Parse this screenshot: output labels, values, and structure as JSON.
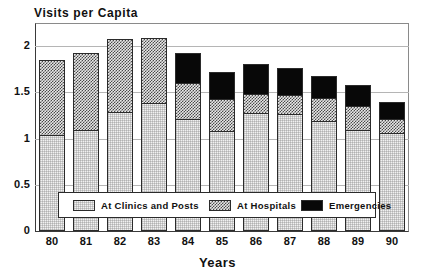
{
  "chart_data": {
    "type": "bar",
    "subtype": "stacked-vertical",
    "title": "Visits per Capita",
    "xlabel": "Years",
    "ylabel": "",
    "categories": [
      "80",
      "81",
      "82",
      "83",
      "84",
      "85",
      "86",
      "87",
      "88",
      "89",
      "90"
    ],
    "series": [
      {
        "name": "At Clinics and Posts",
        "fill": "light-dotted",
        "values": [
          1.03,
          1.08,
          1.28,
          1.37,
          1.2,
          1.07,
          1.27,
          1.25,
          1.18,
          1.08,
          1.05
        ]
      },
      {
        "name": "At Hospitals",
        "fill": "checkerboard-hatch",
        "values": [
          0.81,
          0.84,
          0.79,
          0.71,
          0.39,
          0.35,
          0.2,
          0.21,
          0.25,
          0.26,
          0.15
        ]
      },
      {
        "name": "Emergencies",
        "fill": "solid-black",
        "values": [
          0.0,
          0.0,
          0.0,
          0.0,
          0.32,
          0.29,
          0.33,
          0.29,
          0.24,
          0.23,
          0.18
        ]
      }
    ],
    "totals": [
      1.84,
      1.92,
      2.07,
      2.08,
      1.91,
      1.71,
      1.8,
      1.75,
      1.67,
      1.57,
      1.38
    ],
    "ylim": [
      0,
      2.25
    ],
    "yticks": [
      "0",
      "0.5",
      "1",
      "1.5",
      "2"
    ],
    "ytick_values": [
      0,
      0.5,
      1,
      1.5,
      2
    ],
    "grid": true,
    "grid_axis": "y",
    "legend_position": "inside-bottom-center",
    "colors": {
      "clinics": "#f1f1f1",
      "hospitals": "#9a9a9a",
      "emergencies": "#080808",
      "axis": "#2b2b2b",
      "gridline": "#b5b5b5"
    }
  },
  "legend": {
    "items": [
      {
        "label": "At Clinics and Posts",
        "swatch": "light-dotted"
      },
      {
        "label": "At Hospitals",
        "swatch": "checkerboard-hatch"
      },
      {
        "label": "Emergencies",
        "swatch": "solid-black"
      }
    ]
  }
}
